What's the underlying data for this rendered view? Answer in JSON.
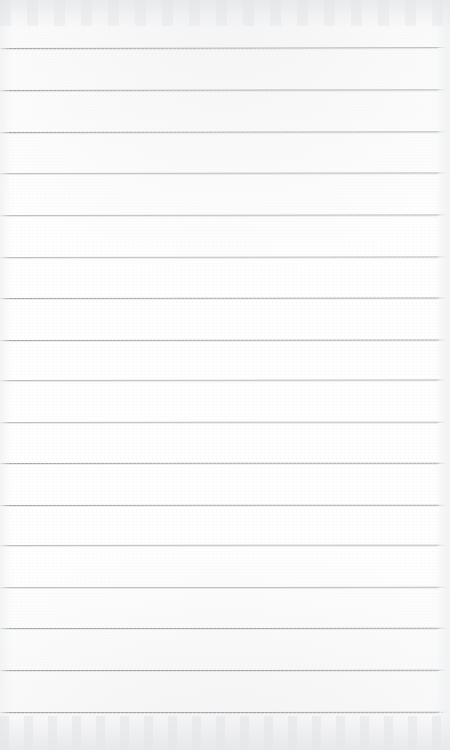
{
  "page": {
    "kind": "scanned-lined-paper",
    "width": 450,
    "height": 750,
    "paper_color": "#ffffff",
    "content_text": "",
    "note": ""
  },
  "ruling": {
    "line_color": "#9ea0a3",
    "line_thickness_px": 1,
    "line_count": 17,
    "spacing_px": 41.6,
    "first_line_y": 48,
    "line_left_x": 0,
    "line_right_x": 438,
    "lines": [
      {
        "index": 1,
        "y": 48,
        "x_start": 0,
        "x_end": 438,
        "tilt_deg": -0.12
      },
      {
        "index": 2,
        "y": 90,
        "x_start": 0,
        "x_end": 438,
        "tilt_deg": -0.1
      },
      {
        "index": 3,
        "y": 132,
        "x_start": 0,
        "x_end": 438,
        "tilt_deg": -0.1
      },
      {
        "index": 4,
        "y": 173,
        "x_start": 0,
        "x_end": 438,
        "tilt_deg": -0.08
      },
      {
        "index": 5,
        "y": 215,
        "x_start": 0,
        "x_end": 438,
        "tilt_deg": -0.08
      },
      {
        "index": 6,
        "y": 257,
        "x_start": 0,
        "x_end": 438,
        "tilt_deg": -0.06
      },
      {
        "index": 7,
        "y": 298,
        "x_start": 0,
        "x_end": 438,
        "tilt_deg": -0.06
      },
      {
        "index": 8,
        "y": 340,
        "x_start": 0,
        "x_end": 438,
        "tilt_deg": -0.05
      },
      {
        "index": 9,
        "y": 380,
        "x_start": 0,
        "x_end": 438,
        "tilt_deg": -0.05
      },
      {
        "index": 10,
        "y": 422,
        "x_start": 0,
        "x_end": 438,
        "tilt_deg": -0.04
      },
      {
        "index": 11,
        "y": 463,
        "x_start": 0,
        "x_end": 438,
        "tilt_deg": -0.04
      },
      {
        "index": 12,
        "y": 505,
        "x_start": 0,
        "x_end": 438,
        "tilt_deg": -0.03
      },
      {
        "index": 13,
        "y": 545,
        "x_start": 0,
        "x_end": 438,
        "tilt_deg": -0.03
      },
      {
        "index": 14,
        "y": 587,
        "x_start": 0,
        "x_end": 438,
        "tilt_deg": -0.02
      },
      {
        "index": 15,
        "y": 628,
        "x_start": 0,
        "x_end": 438,
        "tilt_deg": -0.02
      },
      {
        "index": 16,
        "y": 670,
        "x_start": 0,
        "x_end": 438,
        "tilt_deg": -0.02
      },
      {
        "index": 17,
        "y": 712,
        "x_start": 0,
        "x_end": 438,
        "tilt_deg": -0.02
      }
    ]
  },
  "artifacts": {
    "top_smudge_color": "#e2e3e6",
    "bottom_smudge_color": "#e4e5e8",
    "edge_shadow_color": "#f0f1f3"
  }
}
